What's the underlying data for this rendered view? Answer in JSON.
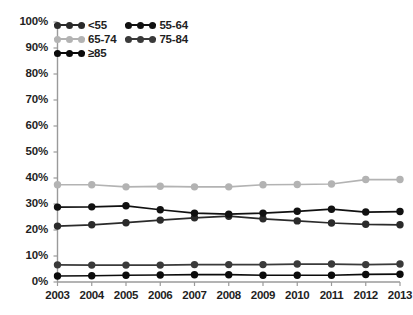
{
  "chart_data": {
    "type": "line",
    "title": "",
    "subtitle": "",
    "xlabel": "",
    "ylabel": "",
    "x": [
      2003,
      2004,
      2005,
      2006,
      2007,
      2008,
      2009,
      2010,
      2011,
      2012,
      2013
    ],
    "categories": [
      "2003",
      "2004",
      "2005",
      "2006",
      "2007",
      "2008",
      "2009",
      "2010",
      "2011",
      "2012",
      "2013"
    ],
    "xlim": [
      2003,
      2013
    ],
    "ylim": [
      0,
      100
    ],
    "ytick_labels": [
      "0%",
      "10%",
      "20%",
      "30%",
      "40%",
      "50%",
      "60%",
      "70%",
      "80%",
      "90%",
      "100%"
    ],
    "ytick_values": [
      0,
      10,
      20,
      30,
      40,
      50,
      60,
      70,
      80,
      90,
      100
    ],
    "grid": false,
    "legend_position": "top-left",
    "markers": "filled-circle",
    "series": [
      {
        "name": "<55",
        "color": "#2b2b2b",
        "values": [
          21.5,
          22.0,
          22.8,
          23.8,
          24.7,
          25.3,
          24.3,
          23.5,
          22.7,
          22.2,
          22.0
        ]
      },
      {
        "name": "55-64",
        "color": "#111111",
        "values": [
          28.8,
          28.9,
          29.3,
          27.8,
          26.5,
          26.1,
          26.5,
          27.2,
          28.0,
          26.9,
          27.1
        ]
      },
      {
        "name": "65-74",
        "color": "#b3b3b3",
        "values": [
          37.4,
          37.4,
          36.6,
          36.8,
          36.6,
          36.6,
          37.4,
          37.5,
          37.7,
          39.4,
          39.4
        ]
      },
      {
        "name": "75-84",
        "color": "#3a3a3a",
        "values": [
          6.6,
          6.5,
          6.5,
          6.5,
          6.7,
          6.7,
          6.7,
          6.9,
          6.9,
          6.7,
          6.9
        ]
      },
      {
        "name": "≥85",
        "color": "#0b0b0b",
        "values": [
          2.3,
          2.4,
          2.6,
          2.7,
          2.8,
          2.8,
          2.6,
          2.6,
          2.6,
          2.9,
          3.0
        ]
      }
    ]
  },
  "legend": {
    "entries": [
      {
        "label": "<55",
        "color": "#2b2b2b"
      },
      {
        "label": "55-64",
        "color": "#111111"
      },
      {
        "label": "65-74",
        "color": "#b3b3b3"
      },
      {
        "label": "75-84",
        "color": "#3a3a3a"
      },
      {
        "label": "≥85",
        "color": "#0b0b0b"
      }
    ]
  },
  "axes": {
    "y_axis_color": "#9a9a9a",
    "x_axis_color": "#9a9a9a"
  }
}
